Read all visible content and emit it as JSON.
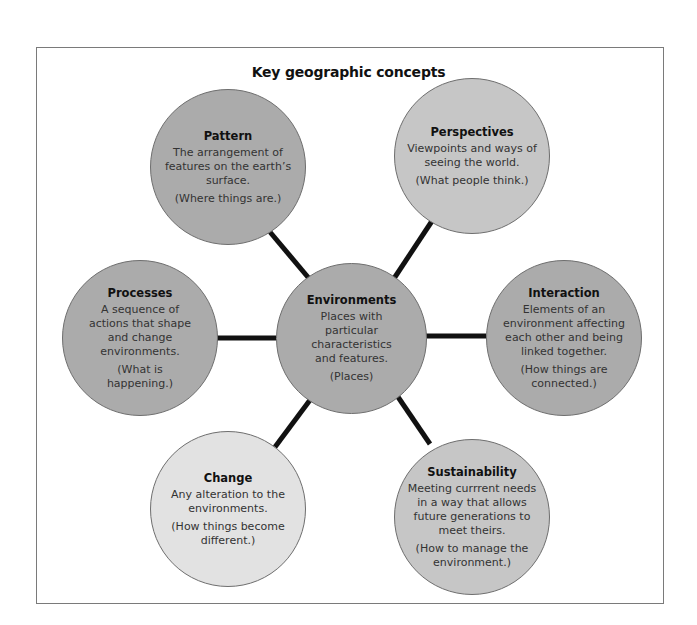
{
  "diagram": {
    "title": "Key geographic concepts",
    "colors": {
      "mid": "#ababab",
      "light": "#c6c6c6",
      "lightest": "#e2e2e2",
      "connector": "#111111",
      "frame_border": "#7a7a7a"
    },
    "center": {
      "name": "Environments",
      "desc": "Places with particular characteristics and features.",
      "note": "(Places)"
    },
    "nodes": [
      {
        "id": "pattern",
        "name": "Pattern",
        "desc": "The arrangement of features on the earth’s surface.",
        "note": "(Where things are.)"
      },
      {
        "id": "perspectives",
        "name": "Perspectives",
        "desc": "Viewpoints and ways of seeing the world.",
        "note": "(What people think.)"
      },
      {
        "id": "processes",
        "name": "Processes",
        "desc": "A sequence of actions that shape and change environments.",
        "note": "(What is happening.)"
      },
      {
        "id": "interaction",
        "name": "Interaction",
        "desc": "Elements of an environment affecting each other and being linked together.",
        "note": "(How things are connected.)"
      },
      {
        "id": "change",
        "name": "Change",
        "desc": "Any alteration to the environments.",
        "note": "(How things become different.)"
      },
      {
        "id": "sustainability",
        "name": "Sustainability",
        "desc": "Meeting currrent needs in a way that allows future generations to meet theirs.",
        "note": "(How to manage the environment.)"
      }
    ]
  }
}
